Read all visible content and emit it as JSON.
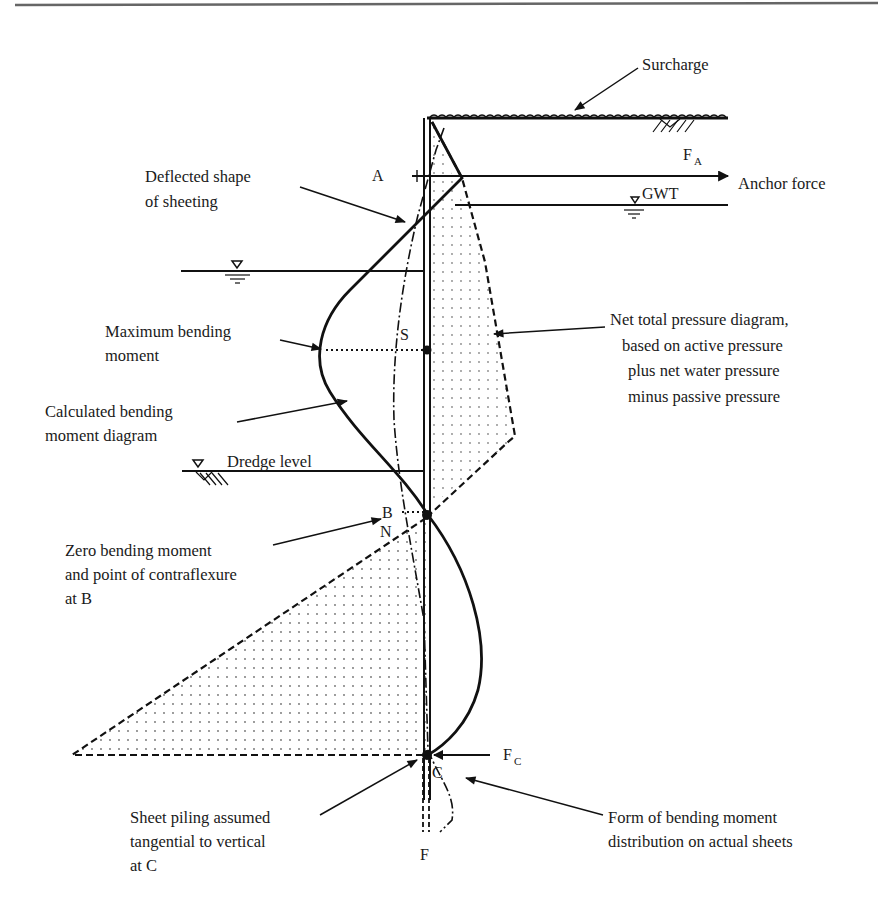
{
  "figure": {
    "type": "anchored sheet pile wall - free earth support diagram",
    "labels": {
      "surcharge": "Surcharge",
      "anchor_force_symbol": "F",
      "anchor_force_sub": "A",
      "anchor_force": "Anchor force",
      "gwt": "GWT",
      "point_a": "A",
      "point_s": "S",
      "point_b": "B",
      "point_n": "N",
      "point_c": "C",
      "point_f": "F",
      "reaction_symbol": "F",
      "reaction_sub": "C",
      "dredge_level": "Dredge level"
    },
    "annotations": {
      "deflected_shape": [
        "Deflected shape",
        "of sheeting"
      ],
      "max_bending_moment": [
        "Maximum bending",
        "moment"
      ],
      "calc_bm_diagram": [
        "Calculated bending",
        "moment diagram"
      ],
      "zero_bm": [
        "Zero bending moment",
        "and point of contraflexure",
        "at B"
      ],
      "net_pressure": [
        "Net total pressure diagram,",
        "based on active pressure",
        "plus net water pressure",
        "minus passive pressure"
      ],
      "tangential": [
        "Sheet piling assumed",
        "tangential to vertical",
        "at C"
      ],
      "actual_bm": [
        "Form of bending moment",
        "distribution on actual sheets"
      ]
    }
  }
}
